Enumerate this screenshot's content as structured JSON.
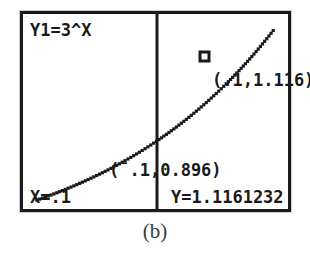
{
  "figure": {
    "caption": "(b)",
    "device": "graphing-calculator-screen"
  },
  "screen": {
    "function_label": "Y1=3^X",
    "cursor_marker": "square",
    "annotations": {
      "upper_point_label": "(.1,1.116)",
      "lower_point_label_neg": "¯",
      "lower_point_label_rest": "(",
      "lower_point_label": "(¯.1,0.896)"
    },
    "readouts": {
      "x_label": "X=.1",
      "y_label": "Y=1.1161232"
    }
  },
  "colors": {
    "ink": "#1a1a1a",
    "screen_background": "#ffffff",
    "caption_ink": "#3b3b3b"
  },
  "chart_data": {
    "type": "line",
    "title": "Y1=3^X",
    "xlabel": "",
    "ylabel": "",
    "expression": "y = 3^x",
    "grid": false,
    "legend": null,
    "axis_visible": {
      "vertical_cursor_line": true,
      "horizontal_axis": false
    },
    "cursor": {
      "x": 0.1,
      "y": 1.1161232,
      "x_display": "X=.1",
      "y_display": "Y=1.1161232"
    },
    "annotated_points": [
      {
        "label": "(.1,1.116)",
        "x": 0.1,
        "y": 1.116,
        "marker": "square"
      },
      {
        "label": "(¯.1,0.896)",
        "x": -0.1,
        "y": 0.896,
        "marker": "none"
      }
    ],
    "series": [
      {
        "name": "Y1=3^X",
        "style": "dotted",
        "x": [
          -0.65,
          -0.55,
          -0.45,
          -0.35,
          -0.25,
          -0.15,
          -0.05,
          0.05,
          0.15,
          0.25,
          0.35,
          0.45,
          0.55
        ],
        "y": [
          0.478,
          0.54,
          0.61,
          0.689,
          0.778,
          0.879,
          0.993,
          1.057,
          1.184,
          1.327,
          1.487,
          1.667,
          1.868
        ]
      }
    ],
    "xlim": [
      -0.72,
      0.62
    ],
    "ylim": [
      0.42,
      1.95
    ]
  }
}
